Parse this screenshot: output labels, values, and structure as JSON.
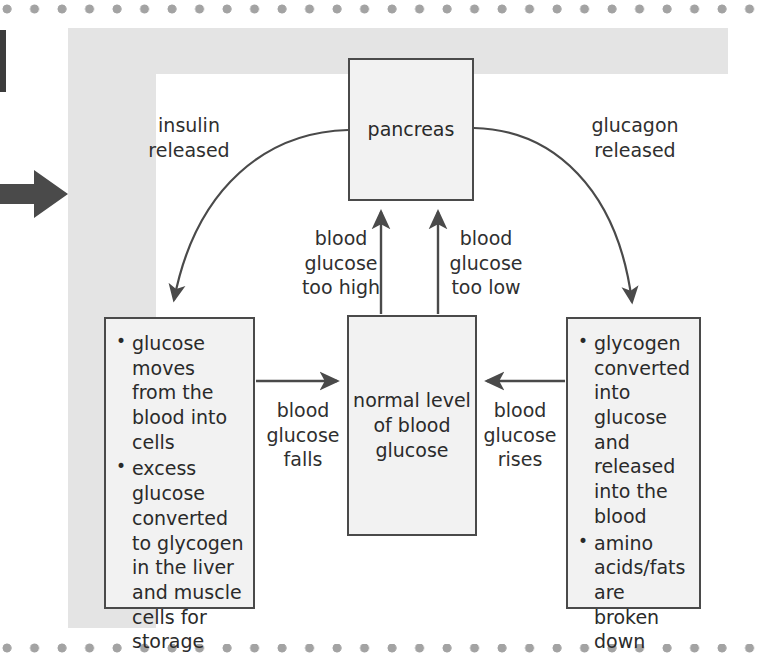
{
  "page": {
    "kind": "textbook-scan-page",
    "dot_rule_color": "#a3a3a3",
    "panel_bg_color": "#e4e4e4",
    "card_bg_color": "#ffffff",
    "stroke_color": "#4a4a4a",
    "node_fill_color": "#f2f2f2",
    "marker_arrow_color": "#3c3c3c"
  },
  "diagram": {
    "nodes": {
      "pancreas": {
        "label": "pancreas"
      },
      "normal": {
        "lines": "normal\nlevel\nof blood\nglucose"
      },
      "left_effects": {
        "bullets": [
          "glucose moves from the blood into cells",
          "excess glucose converted to glycogen in the liver and muscle cells for storage"
        ]
      },
      "right_effects": {
        "bullets": [
          "glycogen converted into glucose and released into the blood",
          "amino acids/fats are broken down"
        ]
      }
    },
    "edge_labels": {
      "insulin_released": "insulin\nreleased",
      "glucagon_released": "glucagon\nreleased",
      "glucose_too_high": "blood\nglucose\ntoo high",
      "glucose_too_low": "blood\nglucose\ntoo low",
      "glucose_falls": "blood\nglucose\nfalls",
      "glucose_rises": "blood\nglucose\nrises"
    }
  }
}
